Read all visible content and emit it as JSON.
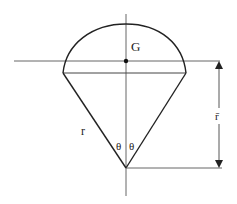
{
  "diagram": {
    "title": "",
    "labels": {
      "centroid": "G",
      "radius": "r",
      "half_angle_left": "θ",
      "half_angle_right": "θ",
      "centroid_distance": "r̄"
    },
    "elements": [
      "vertical symmetry axis",
      "circular arc (spherical cap)",
      "chord of cap",
      "two slant radii meeting at apex",
      "horizontal line through centroid G",
      "horizontal reference line through apex",
      "double-headed dimension arrow between the two horizontal lines"
    ],
    "colors": {
      "line": "#222222",
      "thin_line": "#555555",
      "background": "#ffffff"
    }
  }
}
